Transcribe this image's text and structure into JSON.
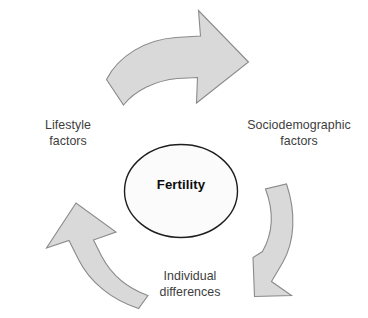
{
  "diagram": {
    "type": "cycle-diagram",
    "title_visible": false,
    "hub": {
      "label": "Fertility",
      "shape": "ellipse",
      "fill_color": "#fbfbfb",
      "stroke_color": "#1e1e1e"
    },
    "labels": {
      "lifestyle": "Lifestyle\nfactors",
      "lifestyle_line1": "Lifestyle",
      "lifestyle_line2": "factors",
      "sociodemographic_line1": "Sociodemographic",
      "sociodemographic_line2": "factors",
      "individual_line1": "Individual",
      "individual_line2": "differences"
    },
    "arrows": [
      {
        "name": "arrow-top",
        "direction": "clockwise",
        "points_toward": "Sociodemographic factors",
        "fill_color": "#d9d9d9",
        "stroke_color": "#8a8a8a"
      },
      {
        "name": "arrow-right",
        "direction": "clockwise",
        "points_toward": "Individual differences",
        "fill_color": "#d9d9d9",
        "stroke_color": "#8a8a8a"
      },
      {
        "name": "arrow-left",
        "direction": "clockwise",
        "points_toward": "Lifestyle factors",
        "fill_color": "#d9d9d9",
        "stroke_color": "#8a8a8a"
      }
    ],
    "colors": {
      "background": "#ffffff",
      "arrow_fill": "#d9d9d9",
      "arrow_stroke": "#8a8a8a",
      "label_text": "#3d3d3d",
      "hub_text": "#0d0d0d"
    }
  }
}
